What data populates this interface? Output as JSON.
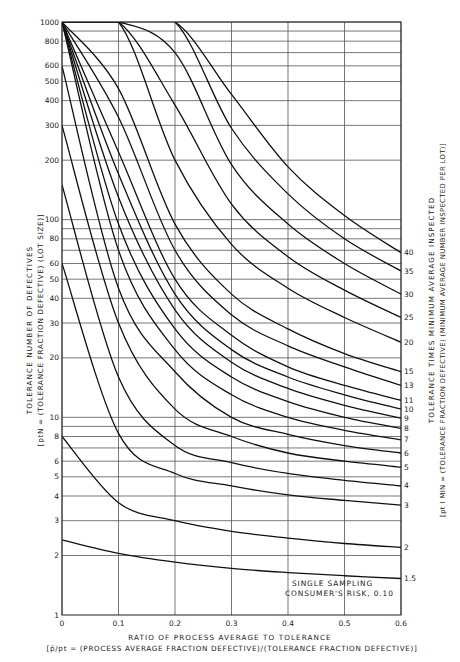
{
  "chart_data": {
    "type": "line",
    "annotation": [
      "SINGLE SAMPLING",
      "CONSUMER'S RISK, 0.10"
    ],
    "xlabel": "RATIO OF PROCESS AVERAGE TO TOLERANCE",
    "xlabel_sub": "[p̄/pt = (PROCESS AVERAGE FRACTION DEFECTIVE)/(TOLERANCE FRACTION DEFECTIVE)]",
    "ylabel": "TOLERANCE NUMBER OF DEFECTIVES",
    "ylabel_sub": "[ptN = (TOLERANCE FRACTION DEFECTIVE) (LOT SIZE)]",
    "y2label": "TOLERANCE TIMES MINIMUM AVERAGE INSPECTED",
    "y2label_sub": "[pt I MIN = (TOLERANCE FRACTION DEFECTIVE) (MINIMUM AVERAGE NUMBER INSPECTED PER LOT)]",
    "xlim": [
      0,
      0.6
    ],
    "ylim": [
      1,
      1000
    ],
    "yscale": "log",
    "grid": true,
    "x_ticks": [
      "0",
      "0.1",
      "0.2",
      "0.3",
      "0.4",
      "0.5",
      "0.6"
    ],
    "y_ticks": [
      "1",
      "2",
      "3",
      "4",
      "5",
      "6",
      "8",
      "10",
      "20",
      "30",
      "40",
      "50",
      "60",
      "80",
      "100",
      "200",
      "300",
      "400",
      "500",
      "600",
      "800",
      "1000"
    ],
    "y_gridlines": [
      2,
      3,
      4,
      5,
      6,
      7,
      8,
      9,
      10,
      20,
      30,
      40,
      50,
      60,
      70,
      80,
      90,
      100,
      200,
      300,
      400,
      500,
      600,
      700,
      800,
      900,
      1000
    ],
    "x": [
      0,
      0.1,
      0.2,
      0.3,
      0.4,
      0.5,
      0.6
    ],
    "series": [
      {
        "name": "1.5",
        "values": [
          2.4,
          2.05,
          1.85,
          1.72,
          1.64,
          1.58,
          1.53
        ]
      },
      {
        "name": "2",
        "values": [
          8,
          3.7,
          3.0,
          2.65,
          2.45,
          2.3,
          2.2
        ]
      },
      {
        "name": "3",
        "values": [
          60,
          8.3,
          5.2,
          4.5,
          4.05,
          3.8,
          3.6
        ]
      },
      {
        "name": "4",
        "values": [
          150,
          16,
          7.2,
          5.9,
          5.2,
          4.8,
          4.5
        ]
      },
      {
        "name": "5",
        "values": [
          300,
          30,
          11,
          8.0,
          6.6,
          6.0,
          5.6
        ]
      },
      {
        "name": "6",
        "values": [
          600,
          45,
          17,
          10,
          8.2,
          7.2,
          6.6
        ]
      },
      {
        "name": "7",
        "values": [
          1000,
          70,
          22,
          13,
          10,
          8.6,
          7.7
        ]
      },
      {
        "name": "8",
        "values": [
          1000,
          95,
          28,
          16,
          12,
          10,
          8.8
        ]
      },
      {
        "name": "9",
        "values": [
          1000,
          130,
          35,
          19,
          14,
          11.5,
          9.9
        ]
      },
      {
        "name": "10",
        "values": [
          1000,
          170,
          42,
          22,
          16,
          13,
          11
        ]
      },
      {
        "name": "11",
        "values": [
          1000,
          220,
          50,
          26,
          18,
          14.5,
          12.2
        ]
      },
      {
        "name": "13",
        "values": [
          1000,
          330,
          70,
          33,
          23,
          18,
          14.5
        ]
      },
      {
        "name": "15",
        "values": [
          1000,
          460,
          95,
          42,
          28,
          21,
          17
        ]
      },
      {
        "name": "20",
        "values": [
          1000,
          1000,
          200,
          75,
          45,
          32,
          24
        ]
      },
      {
        "name": "25",
        "values": [
          1000,
          1000,
          380,
          120,
          65,
          44,
          32
        ]
      },
      {
        "name": "30",
        "values": [
          1000,
          1000,
          700,
          190,
          95,
          60,
          42
        ]
      },
      {
        "name": "35",
        "values": [
          1000,
          1000,
          1000,
          290,
          135,
          80,
          55
        ]
      },
      {
        "name": "40",
        "values": [
          1000,
          1000,
          1000,
          430,
          185,
          105,
          68
        ]
      }
    ],
    "right_edge_labels": [
      "40",
      "35",
      "30",
      "25",
      "20",
      "15",
      "13",
      "11",
      "10",
      "9",
      "8",
      "7",
      "6",
      "5",
      "4",
      "3",
      "2",
      "1.5"
    ]
  }
}
